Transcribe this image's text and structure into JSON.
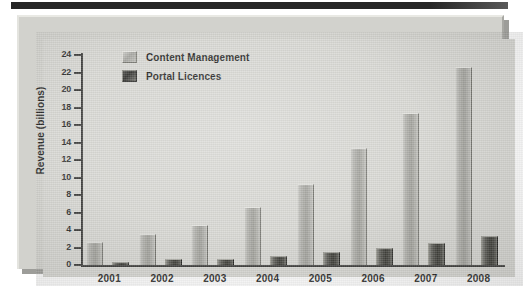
{
  "chart_data": {
    "type": "bar",
    "title": "",
    "xlabel": "",
    "ylabel": "Revenue (billions)",
    "ylim": [
      0,
      24
    ],
    "ytick_step": 2,
    "yticks": [
      0,
      2,
      4,
      6,
      8,
      10,
      12,
      14,
      16,
      18,
      20,
      22,
      24
    ],
    "ytick_labels": [
      "0",
      "2",
      "4",
      "6",
      "8",
      "10",
      "12",
      "14",
      "16",
      "18",
      "20",
      "22",
      "24"
    ],
    "grid": false,
    "legend_position": "upper-left-inside",
    "categories": [
      "2001",
      "2002",
      "2003",
      "2004",
      "2005",
      "2006",
      "2007",
      "2008"
    ],
    "series": [
      {
        "name": "Content Management",
        "color": "#a3a39e",
        "values": [
          2.6,
          3.5,
          4.6,
          6.6,
          9.3,
          13.4,
          17.4,
          22.6
        ]
      },
      {
        "name": "Portal Licences",
        "color": "#35352f",
        "values": [
          0.4,
          0.7,
          0.7,
          1.0,
          1.5,
          1.9,
          2.5,
          3.3
        ]
      }
    ]
  },
  "axis": {
    "y_title": "Revenue (billions)"
  },
  "legend": {
    "items": [
      {
        "label": "Content Management",
        "swatch": "legend-swatch-content-management"
      },
      {
        "label": "Portal Licences",
        "swatch": "legend-swatch-portal-licences"
      }
    ]
  },
  "colors": {
    "panel_background": "#d7d7d2",
    "frame_background": "#d2d2cd",
    "axis": "#3a3a38",
    "text": "#1f1f1e",
    "series_content_management": "#a3a39e",
    "series_portal_licences": "#35352f",
    "top_strip": "#262626"
  }
}
